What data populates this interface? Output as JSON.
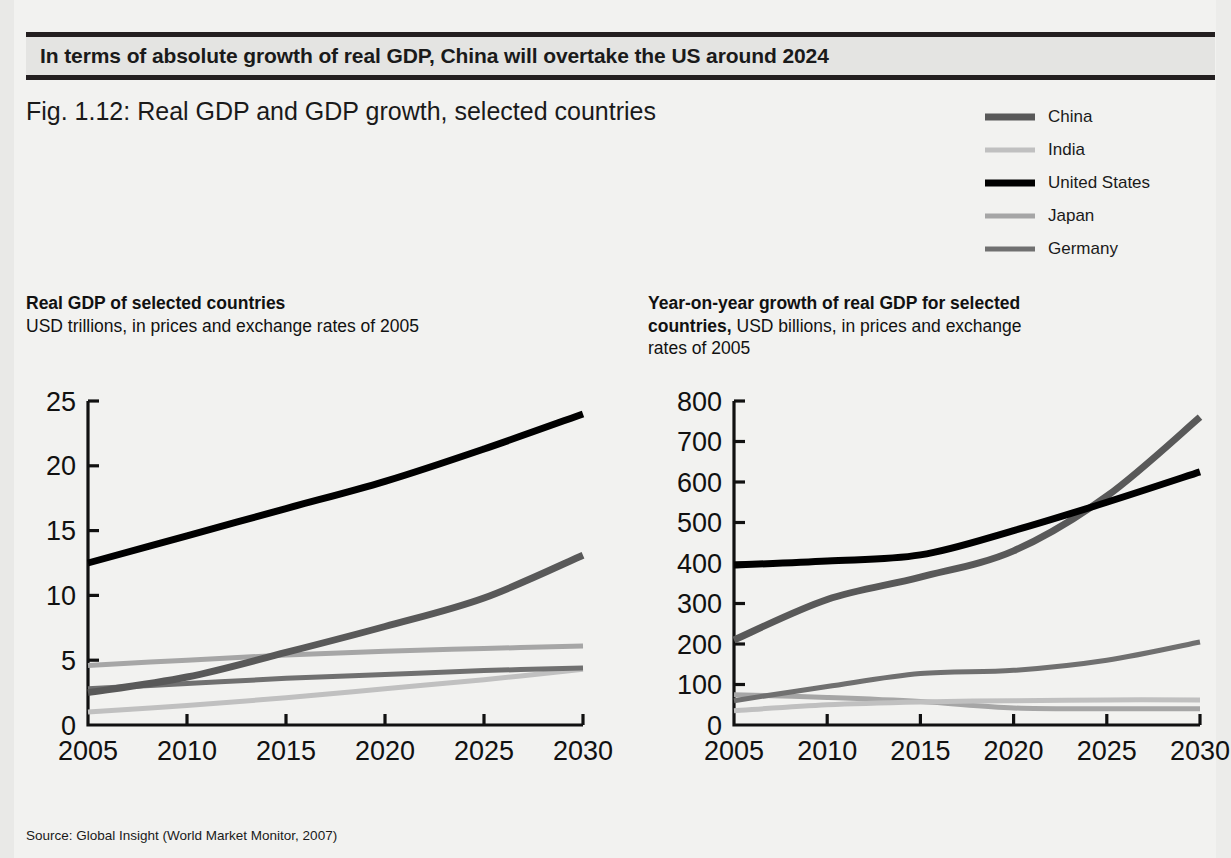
{
  "banner": {
    "text": "In terms of absolute growth of real GDP, China will overtake the US around 2024"
  },
  "figure": {
    "title": "Fig. 1.12: Real GDP and GDP growth, selected countries",
    "source": "Source:  Global Insight (World Market Monitor, 2007)"
  },
  "legend": {
    "position": "top-right",
    "items": [
      {
        "label": "China",
        "color": "#595959",
        "width": 7
      },
      {
        "label": "India",
        "color": "#c0c0c0",
        "width": 5
      },
      {
        "label": "United States",
        "color": "#000000",
        "width": 7
      },
      {
        "label": "Japan",
        "color": "#a6a6a6",
        "width": 5
      },
      {
        "label": "Germany",
        "color": "#707070",
        "width": 5
      }
    ]
  },
  "panels": {
    "left": {
      "title_bold": "Real GDP of selected countries",
      "title_rest": "USD trillions, in prices and exchange rates of 2005"
    },
    "right": {
      "title_bold": "Year-on-year growth of real GDP for selected countries,",
      "title_rest": "USD billions, in prices and exchange rates of 2005"
    }
  },
  "chart_data": [
    {
      "type": "line",
      "title": "Real GDP of selected countries",
      "subtitle": "USD trillions, in prices and exchange rates of 2005",
      "xlabel": "",
      "ylabel": "USD trillions",
      "x": [
        2005,
        2010,
        2015,
        2020,
        2025,
        2030
      ],
      "xlim": [
        2005,
        2030
      ],
      "ylim": [
        0,
        25
      ],
      "yticks": [
        0,
        5,
        10,
        15,
        20,
        25
      ],
      "xticks": [
        2005,
        2010,
        2015,
        2020,
        2025,
        2030
      ],
      "grid": false,
      "series": [
        {
          "name": "China",
          "color": "#595959",
          "values": [
            2.5,
            3.7,
            5.6,
            7.6,
            9.8,
            13.1
          ]
        },
        {
          "name": "India",
          "color": "#c0c0c0",
          "values": [
            1.0,
            1.5,
            2.1,
            2.8,
            3.5,
            4.3
          ]
        },
        {
          "name": "United States",
          "color": "#000000",
          "values": [
            12.5,
            14.6,
            16.7,
            18.8,
            21.3,
            24.0
          ]
        },
        {
          "name": "Japan",
          "color": "#a6a6a6",
          "values": [
            4.6,
            5.0,
            5.4,
            5.7,
            5.9,
            6.1
          ]
        },
        {
          "name": "Germany",
          "color": "#707070",
          "values": [
            2.8,
            3.2,
            3.6,
            3.9,
            4.2,
            4.4
          ]
        }
      ]
    },
    {
      "type": "line",
      "title": "Year-on-year growth of real GDP for selected countries",
      "subtitle": "USD billions, in prices and exchange rates of 2005",
      "xlabel": "",
      "ylabel": "USD billions",
      "x": [
        2005,
        2010,
        2015,
        2020,
        2025,
        2030
      ],
      "xlim": [
        2005,
        2030
      ],
      "ylim": [
        0,
        800
      ],
      "yticks": [
        0,
        100,
        200,
        300,
        400,
        500,
        600,
        700,
        800
      ],
      "xticks": [
        2005,
        2010,
        2015,
        2020,
        2025,
        2030
      ],
      "grid": false,
      "series": [
        {
          "name": "China",
          "color": "#595959",
          "values": [
            210,
            310,
            365,
            430,
            565,
            760
          ]
        },
        {
          "name": "India",
          "color": "#c0c0c0",
          "values": [
            35,
            50,
            57,
            60,
            62,
            62
          ]
        },
        {
          "name": "United States",
          "color": "#000000",
          "values": [
            395,
            405,
            420,
            480,
            550,
            625
          ]
        },
        {
          "name": "Japan",
          "color": "#a6a6a6",
          "values": [
            75,
            68,
            58,
            42,
            40,
            40
          ]
        },
        {
          "name": "Germany",
          "color": "#707070",
          "values": [
            60,
            95,
            127,
            135,
            160,
            205
          ]
        }
      ],
      "annotations": [
        {
          "text": "China overtakes the US",
          "x": 2024,
          "y": 530
        }
      ]
    }
  ]
}
